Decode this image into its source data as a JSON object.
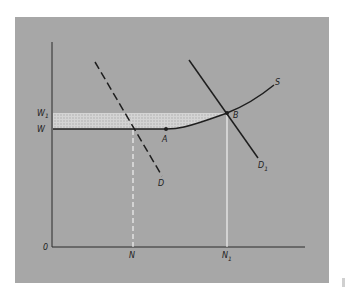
{
  "figure": {
    "background_color": "#a7a7a7",
    "line_color": "#1e1e1e",
    "highlight_color": "#ffffff",
    "shaded_region_color": "#cfcfcf"
  },
  "axes": {
    "origin_label": "0",
    "y_ticks": [
      {
        "label": "W",
        "subscript": ""
      },
      {
        "label": "W",
        "subscript": "1"
      }
    ],
    "x_ticks": [
      {
        "label": "N",
        "subscript": ""
      },
      {
        "label": "N",
        "subscript": "1"
      }
    ]
  },
  "curves": {
    "supply": {
      "label": "S",
      "subscript": "",
      "style": "solid, horizontal at W then rising"
    },
    "demand_initial": {
      "label": "D",
      "subscript": "",
      "style": "dashed"
    },
    "demand_new": {
      "label": "D",
      "subscript": "1",
      "style": "solid"
    }
  },
  "points": {
    "a": {
      "label": "A"
    },
    "b": {
      "label": "B"
    }
  },
  "shaded_region": {
    "description": "crosshatched band between W and W1, left of S up to B"
  }
}
